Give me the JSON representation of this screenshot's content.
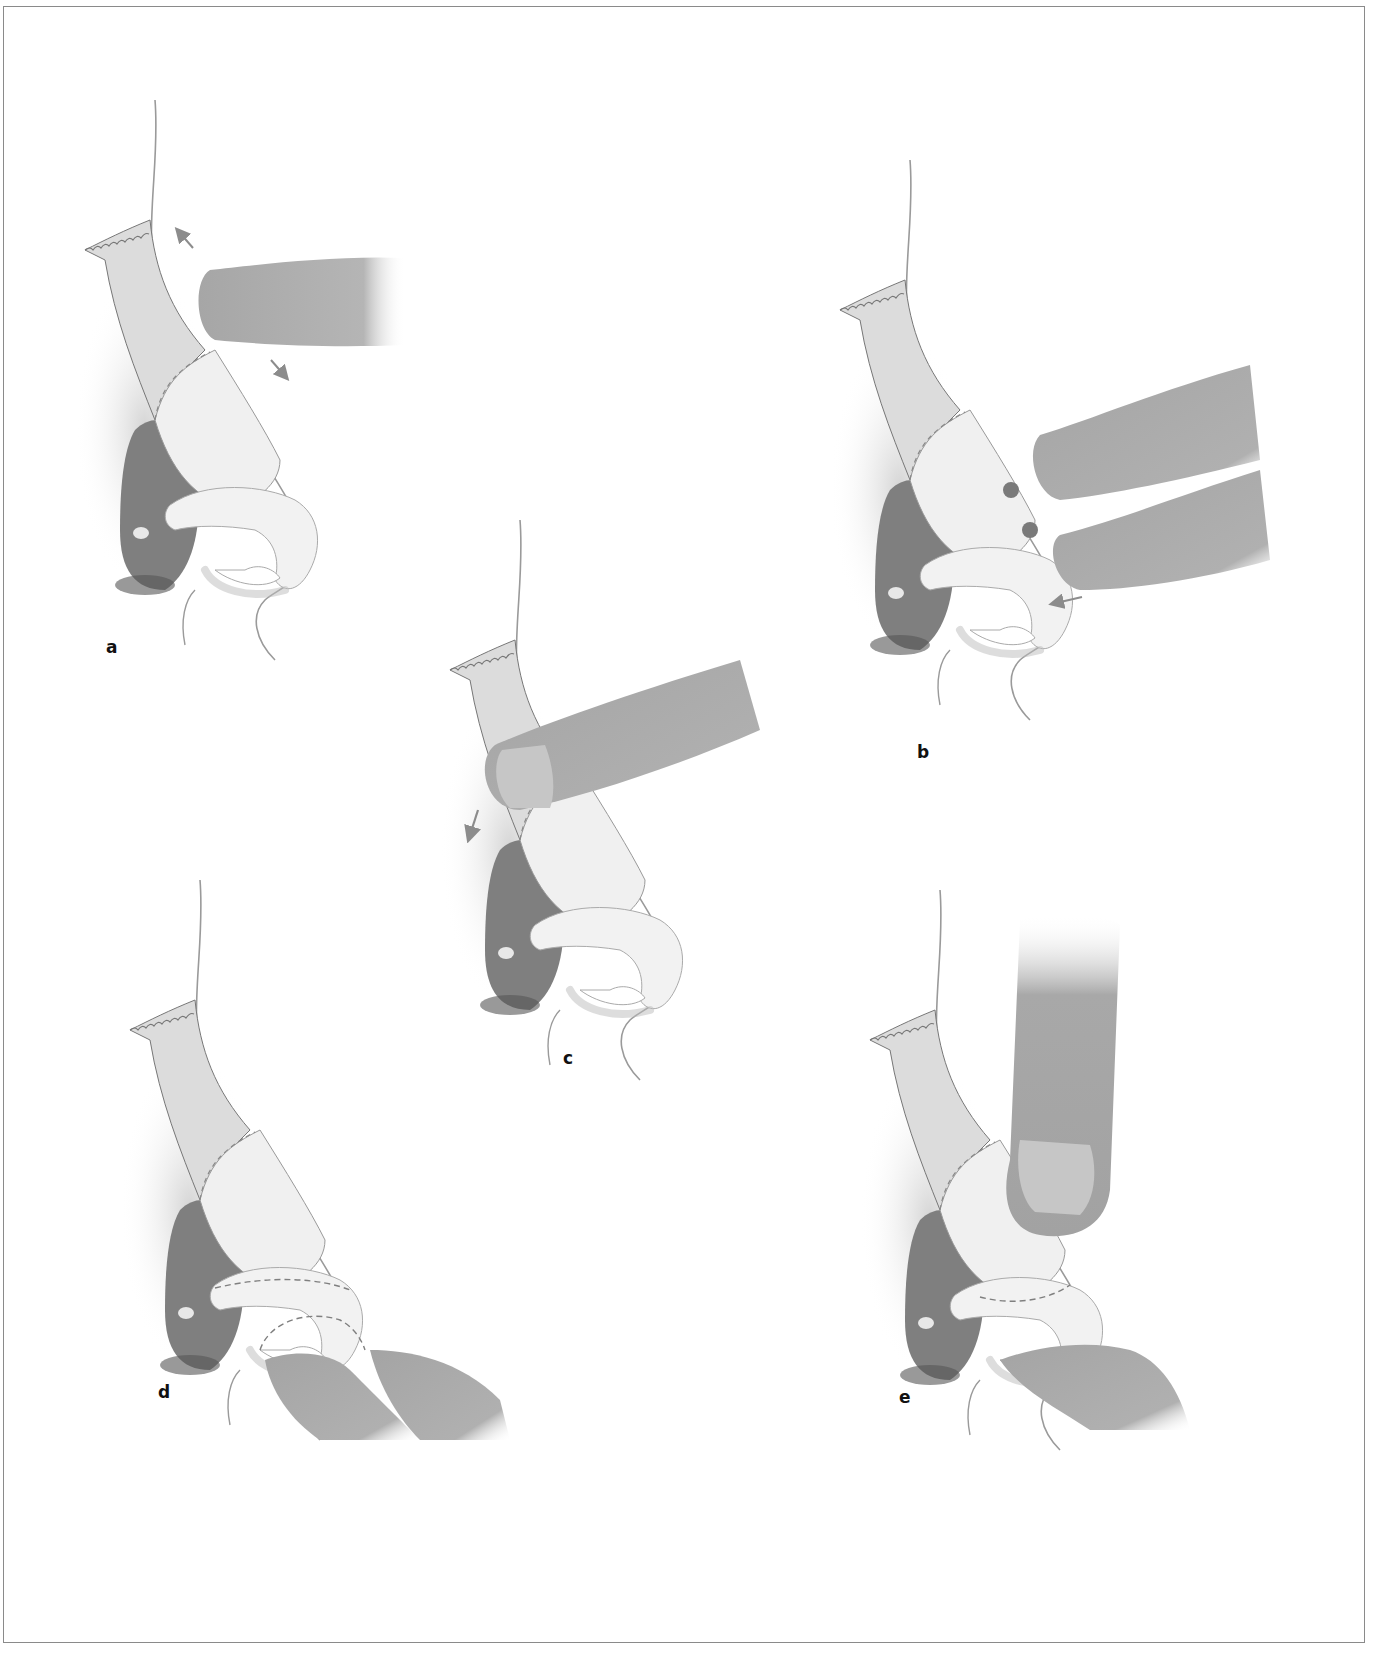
{
  "figure": {
    "colors": {
      "frame": "#8a8a8a",
      "skin_line": "#9a9a9a",
      "bone": "#d9d9d9",
      "cartilage": "#efefef",
      "cavity": "#7d7d7d",
      "finger": "#a8a8a8",
      "nail": "#c6c6c6",
      "arrow": "#8c8c8c",
      "marker": "#7a7a7a"
    },
    "panels": [
      {
        "id": "a",
        "label": "a",
        "description": "Index finger palpating nasal dorsum; arrows indicate gliding motion up and down along the dorsum"
      },
      {
        "id": "b",
        "label": "b",
        "description": "Two fingertips palpating the nasal tip with two marked points on the lateral crus; arrow pointing at columella"
      },
      {
        "id": "c",
        "label": "c",
        "description": "Finger pressing on the upper lateral cartilage with downward arrow"
      },
      {
        "id": "d",
        "label": "d",
        "description": "Thumb and finger grasping the alar base; dashed outlines of the lateral crus"
      },
      {
        "id": "e",
        "label": "e",
        "description": "Thumb pressing from above on the upper lateral cartilage while finger supports from below; dashed outline of the cephalic border"
      }
    ]
  }
}
